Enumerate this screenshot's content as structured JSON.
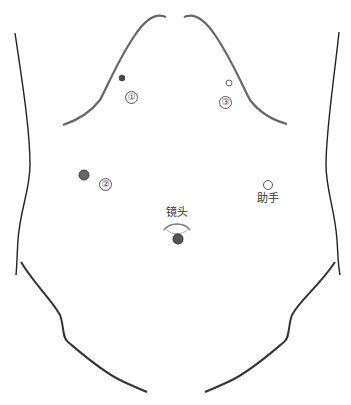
{
  "diagram": {
    "title": "",
    "ports": [
      {
        "id": "port-1",
        "label": "①",
        "x": 122,
        "y": 78,
        "r": 3.2,
        "filled": true,
        "fill": "#4a4a4a",
        "label_x": 125,
        "label_y": 91
      },
      {
        "id": "port-3",
        "label": "③",
        "x": 229,
        "y": 83,
        "r": 3.2,
        "filled": false,
        "fill": "#ffffff",
        "label_x": 220,
        "label_y": 96
      },
      {
        "id": "port-2",
        "label": "②",
        "x": 84,
        "y": 175,
        "r": 5,
        "filled": true,
        "fill": "#666666",
        "label_x": 99,
        "label_y": 179
      },
      {
        "id": "port-assistant",
        "label": "助手",
        "x": 268,
        "y": 185,
        "r": 4.5,
        "filled": false,
        "fill": "#ffffff",
        "label_x": 258,
        "label_y": 194
      },
      {
        "id": "port-camera",
        "label": "镜头",
        "x": 178,
        "y": 239,
        "r": 5,
        "filled": true,
        "fill": "#555555",
        "label_x": 166,
        "label_y": 207
      }
    ],
    "labels": {
      "camera": "镜头",
      "assistant": "助手",
      "port1": "①",
      "port2": "②",
      "port3": "③"
    },
    "colors": {
      "outline": "#222222",
      "costal": "#6a6a6a",
      "port_dark": "#4a4a4a"
    }
  }
}
